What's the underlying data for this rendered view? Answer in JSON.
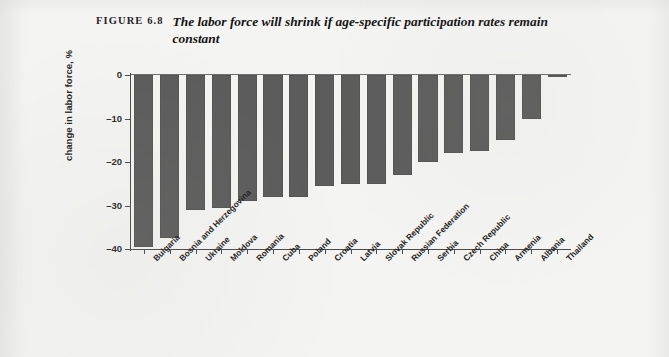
{
  "figure": {
    "label": "FIGURE 6.8",
    "title": "The labor force will shrink if age-specific participation rates remain constant"
  },
  "colors": {
    "bar": "#5c5c5c",
    "axis": "#4a4a4a",
    "text": "#232323",
    "page_background": "#f4f4f2"
  },
  "chart_data": {
    "type": "bar",
    "title": "The labor force will shrink if age-specific participation rates remain constant",
    "xlabel": "",
    "ylabel": "change in labor force, %",
    "ylim": [
      -40,
      0
    ],
    "yticks": [
      0,
      -10,
      -20,
      -30,
      -40
    ],
    "ytick_labels": [
      "0",
      "–10",
      "–20",
      "–30",
      "–40"
    ],
    "grid": false,
    "legend": false,
    "orientation": "vertical",
    "categories": [
      "Bulgaria",
      "Bosnia and Herzegovina",
      "Ukraine",
      "Moldova",
      "Romania",
      "Cuba",
      "Poland",
      "Croatia",
      "Latvia",
      "Slovak Republic",
      "Russian Federation",
      "Serbia",
      "Czech Republic",
      "China",
      "Armenia",
      "Albania",
      "Thailand"
    ],
    "values": [
      -39.5,
      -37.5,
      -31.0,
      -30.5,
      -29.0,
      -28.0,
      -28.0,
      -25.5,
      -25.0,
      -25.0,
      -23.0,
      -20.0,
      -18.0,
      -17.5,
      -15.0,
      -10.0,
      -0.5
    ]
  }
}
